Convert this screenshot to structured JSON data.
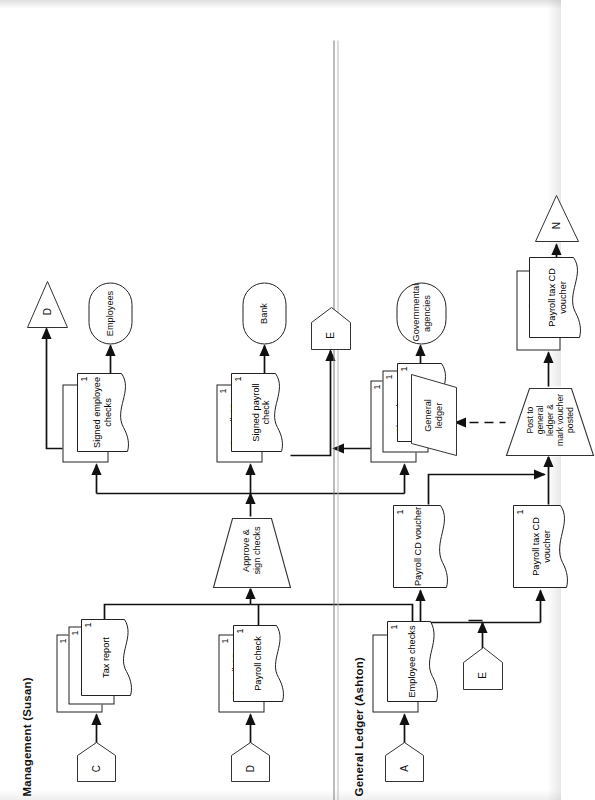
{
  "diagram": {
    "lanes": [
      {
        "id": "management",
        "title": "Management (Susan)"
      },
      {
        "id": "general_ledger",
        "title": "General Ledger (Ashton)"
      }
    ]
  },
  "management": {
    "inputs": [
      {
        "connector": "C",
        "documents": [
          {
            "label": "Payroll tax CD voucher",
            "copy": "1"
          },
          {
            "label": "Tax payment check",
            "copy": "1"
          },
          {
            "label": "Tax report",
            "copy": "1"
          }
        ]
      },
      {
        "connector": "D",
        "documents": [
          {
            "label": "Payroll CD voucher",
            "copy": "1"
          },
          {
            "label": "Payroll check",
            "copy": "1"
          }
        ]
      },
      {
        "connector": "A",
        "documents": [
          {
            "label": "Payroll report",
            "copy": ""
          },
          {
            "label": "Employee checks",
            "copy": "1"
          }
        ]
      }
    ],
    "process": {
      "label": "Approve &\nsign checks"
    },
    "outputs": [
      {
        "documents": [
          {
            "label": "Payroll report",
            "copy": ""
          },
          {
            "label": "Signed employee checks",
            "copy": "1"
          }
        ],
        "destination": "Employees",
        "connector": "D"
      },
      {
        "documents": [
          {
            "label": "Payroll CD voucher",
            "copy": "1"
          },
          {
            "label": "Signed payroll check",
            "copy": "1"
          }
        ],
        "destination": "Bank",
        "connector": "E"
      },
      {
        "documents": [
          {
            "label": "Payroll tax CD voucher",
            "copy": "1"
          },
          {
            "label": "Signed tax payment check",
            "copy": "1"
          },
          {
            "label": "Tax report",
            "copy": "1"
          }
        ],
        "destination": "Governmental agencies",
        "connector": "E"
      }
    ]
  },
  "general_ledger": {
    "connector_in": "E",
    "documents_in": [
      {
        "label": "Payroll tax CD voucher",
        "copy": "1"
      },
      {
        "label": "Payroll CD voucher",
        "copy": "1"
      }
    ],
    "process": {
      "label": "Post to\ngeneral\nledger &\nmark voucher\nposted"
    },
    "store": {
      "label": "General\nledger"
    },
    "documents_out": [
      {
        "label": "Payroll CD voucher",
        "copy": ""
      },
      {
        "label": "Payroll tax CD voucher",
        "copy": ""
      }
    ],
    "connector_out": "N"
  },
  "labels": {
    "c": "C",
    "d": "D",
    "a": "A",
    "e": "E",
    "n": "N"
  }
}
